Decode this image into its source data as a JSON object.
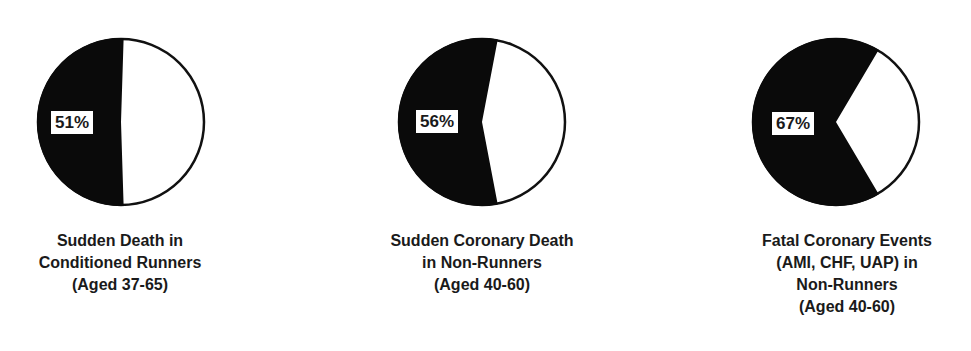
{
  "chart_data": [
    {
      "type": "pie",
      "title": "Sudden Death in Conditioned Runners (Aged 37-65)",
      "label": "51%",
      "slices": [
        {
          "name": "highlighted",
          "value": 51,
          "color": "#000000"
        },
        {
          "name": "remainder",
          "value": 49,
          "color": "#ffffff"
        }
      ],
      "caption_lines": [
        "Sudden Death in",
        "Conditioned Runners",
        "(Aged 37-65)"
      ]
    },
    {
      "type": "pie",
      "title": "Sudden Coronary Death in Non-Runners (Aged 40-60)",
      "label": "56%",
      "slices": [
        {
          "name": "highlighted",
          "value": 56,
          "color": "#000000"
        },
        {
          "name": "remainder",
          "value": 44,
          "color": "#ffffff"
        }
      ],
      "caption_lines": [
        "Sudden Coronary Death",
        "in Non-Runners",
        "(Aged 40-60)"
      ]
    },
    {
      "type": "pie",
      "title": "Fatal Coronary Events (AMI, CHF, UAP) in Non-Runners (Aged 40-60)",
      "label": "67%",
      "slices": [
        {
          "name": "highlighted",
          "value": 67,
          "color": "#000000"
        },
        {
          "name": "remainder",
          "value": 33,
          "color": "#ffffff"
        }
      ],
      "caption_lines": [
        "Fatal Coronary Events",
        "(AMI, CHF, UAP) in",
        "Non-Runners",
        "(Aged 40-60)"
      ]
    }
  ]
}
